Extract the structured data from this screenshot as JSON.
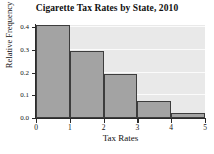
{
  "chart_data": {
    "type": "bar",
    "title": "Cigarette Tax Rates by State, 2010",
    "xlabel": "Tax Rates",
    "ylabel": "Relative Frequency",
    "categories": [
      "0-1",
      "1-2",
      "2-3",
      "3-4",
      "4-5"
    ],
    "bin_edges": [
      0,
      1,
      2,
      3,
      4,
      5
    ],
    "values": [
      0.41,
      0.294,
      0.196,
      0.075,
      0.02
    ],
    "xtick_labels": [
      "0",
      "1",
      "2",
      "3",
      "4",
      "5"
    ],
    "xtick_values": [
      0,
      1,
      2,
      3,
      4,
      5
    ],
    "ytick_labels": [
      "0.0",
      "0.1",
      "0.2",
      "0.3",
      "0.4"
    ],
    "ytick_values": [
      0.0,
      0.1,
      0.2,
      0.3,
      0.4
    ],
    "xlim": [
      0,
      5
    ],
    "ylim": [
      0,
      0.41
    ],
    "grid": true,
    "grid_axis": "y",
    "legend": null,
    "bar_fill_color": "#a3a3a3",
    "bar_edge_color": "#3d3d3d",
    "plot_background_color": "#e9e9e9",
    "gridline_color": "#fbfbfb",
    "axis_color": "#2b2b2b",
    "text_color": "#101010"
  }
}
